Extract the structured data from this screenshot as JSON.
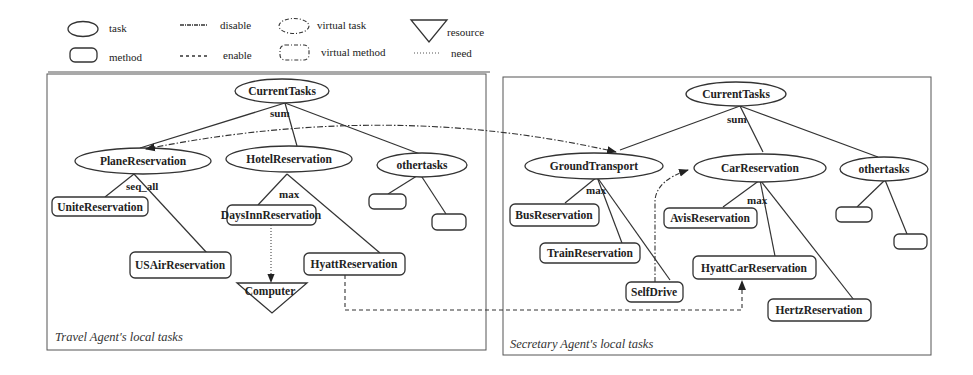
{
  "legend": {
    "task": "task",
    "method": "method",
    "disable": "disable",
    "enable": "enable",
    "virtual_task": "virtual task",
    "virtual_method": "virtual method",
    "resource": "resource",
    "need": "need"
  },
  "left_panel": {
    "caption": "Travel Agent's local tasks",
    "root": "CurrentTasks",
    "root_rel": "sum",
    "tasks": [
      "PlaneReservation",
      "HotelReservation",
      "othertasks"
    ],
    "plane_rel": "seq_all",
    "plane_methods": [
      "UniteReservation",
      "USAirReservation"
    ],
    "hotel_rel": "max",
    "hotel_methods": [
      "DaysInnReservation",
      "HyattReservation"
    ],
    "resource": "Computer"
  },
  "right_panel": {
    "caption": "Secretary Agent's local tasks",
    "root": "CurrentTasks",
    "root_rel": "sum",
    "tasks": [
      "GroundTransport",
      "CarReservation",
      "othertasks"
    ],
    "ground_rel": "max",
    "ground_methods": [
      "BusReservation",
      "TrainReservation",
      "SelfDrive"
    ],
    "car_rel": "max",
    "car_methods": [
      "AvisReservation",
      "HyattCarReservation",
      "HertzReservation"
    ]
  },
  "relations": [
    {
      "type": "disable",
      "from": "GroundTransport",
      "to": "PlaneReservation"
    },
    {
      "type": "disable",
      "from": "SelfDrive",
      "to": "CarReservation"
    },
    {
      "type": "enable",
      "from": "HyattReservation",
      "to": "HyattCarReservation"
    },
    {
      "type": "need",
      "from": "DaysInnReservation",
      "to": "Computer"
    }
  ]
}
